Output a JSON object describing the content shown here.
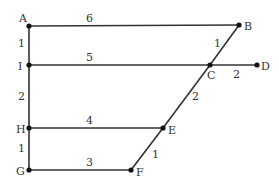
{
  "diagram": {
    "nodes": [
      {
        "id": "A",
        "label": "A",
        "x": 29,
        "y": 26,
        "lx": 19,
        "ly": 22
      },
      {
        "id": "B",
        "label": "B",
        "x": 239,
        "y": 25,
        "lx": 244,
        "ly": 30
      },
      {
        "id": "I",
        "label": "I",
        "x": 29,
        "y": 65,
        "lx": 18,
        "ly": 70
      },
      {
        "id": "C",
        "label": "C",
        "x": 210,
        "y": 65,
        "lx": 207,
        "ly": 79
      },
      {
        "id": "D",
        "label": "D",
        "x": 257,
        "y": 65,
        "lx": 261,
        "ly": 70
      },
      {
        "id": "H",
        "label": "H",
        "x": 29,
        "y": 128,
        "lx": 16,
        "ly": 133
      },
      {
        "id": "E",
        "label": "E",
        "x": 163,
        "y": 128,
        "lx": 168,
        "ly": 134
      },
      {
        "id": "G",
        "label": "G",
        "x": 29,
        "y": 170,
        "lx": 16,
        "ly": 175
      },
      {
        "id": "F",
        "label": "F",
        "x": 131,
        "y": 170,
        "lx": 136,
        "ly": 176
      }
    ],
    "edges": [
      {
        "from": "A",
        "to": "B",
        "weight": "6",
        "wx": 86,
        "wy": 22
      },
      {
        "from": "I",
        "to": "C",
        "weight": "5",
        "wx": 86,
        "wy": 61
      },
      {
        "from": "C",
        "to": "D",
        "weight": "2",
        "wx": 233,
        "wy": 78
      },
      {
        "from": "H",
        "to": "E",
        "weight": "4",
        "wx": 86,
        "wy": 124
      },
      {
        "from": "G",
        "to": "F",
        "weight": "3",
        "wx": 86,
        "wy": 166
      },
      {
        "from": "A",
        "to": "I",
        "weight": "1",
        "wx": 18,
        "wy": 47
      },
      {
        "from": "I",
        "to": "H",
        "weight": "2",
        "wx": 18,
        "wy": 100
      },
      {
        "from": "H",
        "to": "G",
        "weight": "1",
        "wx": 18,
        "wy": 152
      },
      {
        "from": "B",
        "to": "C",
        "weight": "1",
        "wx": 214,
        "wy": 47
      },
      {
        "from": "C",
        "to": "E",
        "weight": "2",
        "wx": 192,
        "wy": 100
      },
      {
        "from": "E",
        "to": "F",
        "weight": "1",
        "wx": 152,
        "wy": 158
      }
    ]
  }
}
